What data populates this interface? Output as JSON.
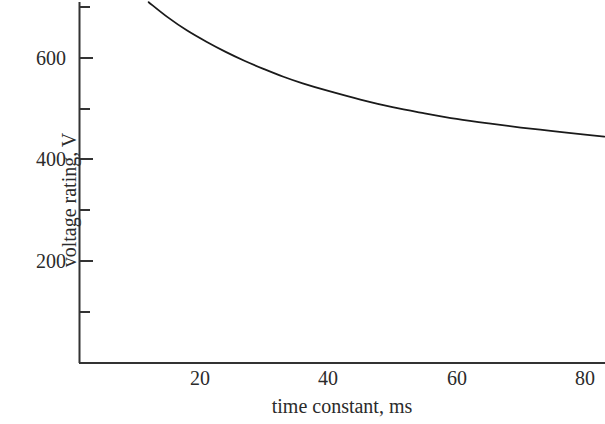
{
  "chart_data": {
    "type": "line",
    "title": "",
    "subtitle": "",
    "xlabel": "time constant, ms",
    "ylabel": "voltage rating, V",
    "xlim": [
      0,
      84
    ],
    "ylim": [
      0,
      715
    ],
    "grid": false,
    "legend": null,
    "annotations": [],
    "x_ticks": [
      20,
      40,
      60,
      80
    ],
    "x_tick_labels": [
      "20",
      "40",
      "60",
      "80"
    ],
    "x_minor_ticks": [],
    "y_ticks": [
      200,
      400,
      600
    ],
    "y_tick_labels": [
      "200",
      "400",
      "600"
    ],
    "y_minor_ticks": [
      100,
      300,
      500,
      700
    ],
    "series": [
      {
        "name": "voltage rating",
        "x": [
          12,
          15,
          18,
          21,
          24,
          27,
          30,
          33,
          36,
          40,
          45,
          50,
          55,
          60,
          65,
          70,
          75,
          80,
          83
        ],
        "y": [
          710,
          680,
          654,
          632,
          612,
          594,
          578,
          563,
          550,
          535,
          518,
          503,
          491,
          480,
          471,
          463,
          456,
          449,
          445
        ]
      }
    ],
    "line_color": "#1a1a1a",
    "axis_color": "#333333"
  },
  "axis_labels": {
    "x_title": "time constant, ms",
    "y_title": "voltage rating, V"
  },
  "ticks": {
    "y": [
      {
        "label": "600",
        "value": 600
      },
      {
        "label": "400",
        "value": 400
      },
      {
        "label": "200",
        "value": 200
      }
    ],
    "x": [
      {
        "label": "20",
        "value": 20
      },
      {
        "label": "40",
        "value": 40
      },
      {
        "label": "60",
        "value": 60
      },
      {
        "label": "80",
        "value": 80
      }
    ]
  }
}
